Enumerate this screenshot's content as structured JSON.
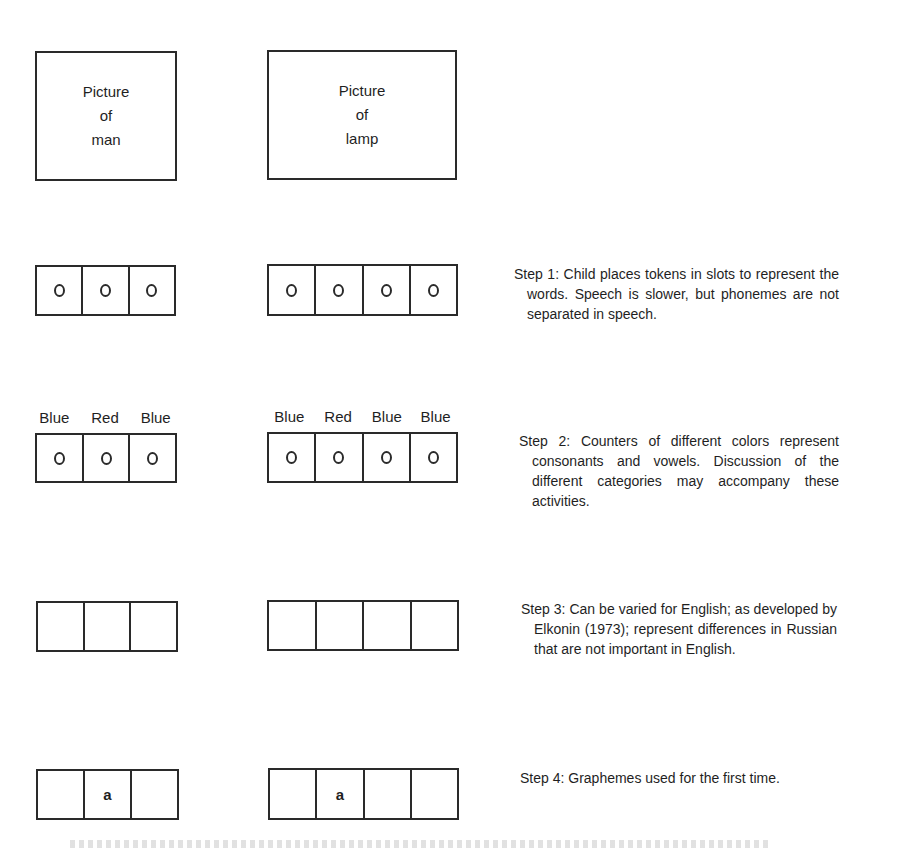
{
  "pictures": {
    "man": {
      "lines": [
        "Picture",
        "of",
        "man"
      ]
    },
    "lamp": {
      "lines": [
        "Picture",
        "of",
        "lamp"
      ]
    }
  },
  "rows": [
    {
      "man": {
        "slots": [
          "token",
          "token",
          "token"
        ]
      },
      "lamp": {
        "slots": [
          "token",
          "token",
          "token",
          "token"
        ]
      },
      "step": "Step 1: Child places tokens in slots to represent the words. Speech is slower, but phonemes are not separated in speech."
    },
    {
      "man": {
        "labels": [
          "Blue",
          "Red",
          "Blue"
        ],
        "slots": [
          "token",
          "token",
          "token"
        ]
      },
      "lamp": {
        "labels": [
          "Blue",
          "Red",
          "Blue",
          "Blue"
        ],
        "slots": [
          "token",
          "token",
          "token",
          "token"
        ]
      },
      "step": "Step 2: Counters of different colors represent consonants and vowels. Discussion of the different categories may accompany these activities."
    },
    {
      "man": {
        "slots": [
          "",
          "",
          ""
        ]
      },
      "lamp": {
        "slots": [
          "",
          "",
          "",
          ""
        ]
      },
      "step": "Step 3: Can be varied for English; as developed by Elkonin (1973); represent differences in Russian that are not important in English."
    },
    {
      "man": {
        "slots": [
          "",
          "a",
          ""
        ]
      },
      "lamp": {
        "slots": [
          "",
          "a",
          "",
          ""
        ]
      },
      "step": "Step 4: Graphemes used for the first time."
    }
  ],
  "text": {
    "pic_man_1": "Picture",
    "pic_man_2": "of",
    "pic_man_3": "man",
    "pic_lamp_1": "Picture",
    "pic_lamp_2": "of",
    "pic_lamp_3": "lamp",
    "r2_man_l1": "Blue",
    "r2_man_l2": "Red",
    "r2_man_l3": "Blue",
    "r2_lamp_l1": "Blue",
    "r2_lamp_l2": "Red",
    "r2_lamp_l3": "Blue",
    "r2_lamp_l4": "Blue",
    "grapheme_a": "a",
    "step1": "Step 1: Child places tokens in slots to represent the words. Speech is slower, but phonemes are not separated in speech.",
    "step2": "Step 2: Counters of different colors represent consonants and vowels. Dis­cussion of the different categories may accompany these activities.",
    "step3": "Step 3: Can be varied for English; as developed by Elkonin (1973); rep­resent differences in Russian that are not important in English.",
    "step4": "Step 4: Graphemes used for the first time."
  }
}
